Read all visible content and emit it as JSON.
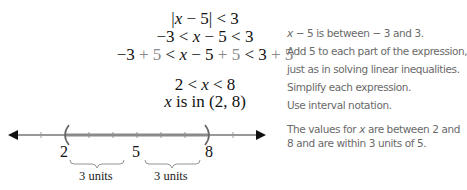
{
  "math_steps": {
    "line1": {
      "abs_open": "|",
      "var": "x",
      "expr": " − 5",
      "abs_close": "|",
      "rest": " < 3"
    },
    "line2": {
      "left": "−3 < ",
      "var": "x",
      "right": " − 5 < 3"
    },
    "line3": {
      "p1": "−3",
      "p2": " + 5",
      "p3": " < ",
      "var": "x",
      "p4": " − 5",
      "p5": " + 5",
      "p6": " < 3",
      "p7": " + 5"
    },
    "line4": {
      "left": "2 < ",
      "var": "x",
      "right": " < 8"
    },
    "line5": {
      "var": "x",
      "text": " is in (2, 8)"
    }
  },
  "explanations": {
    "line1": {
      "var": "x",
      "text": " − 5 is between − 3 and 3."
    },
    "line2": "Add 5 to each part of the expression,",
    "line3": "just as in solving linear inequalities.",
    "line4": "Simplify each expression.",
    "line5": "Use interval notation.",
    "summary_pre": "The values for ",
    "summary_var": "x",
    "summary_post": " are between 2 and 8 and are within 3 units of 5."
  },
  "number_line": {
    "labels": [
      "2",
      "5",
      "8"
    ],
    "interval": {
      "start": 2,
      "end": 8,
      "open_left": true,
      "open_right": true
    },
    "brace_labels": [
      "3 units",
      "3 units"
    ],
    "line_color": "#222222",
    "interval_color": "#8a8a8a"
  }
}
